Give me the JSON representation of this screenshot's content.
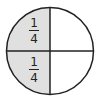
{
  "diagram": {
    "type": "fraction-circle",
    "parts": 4,
    "shaded_parts": 2,
    "shade_color": "#e0e0e0",
    "line_color": "#222222",
    "background": "#ffffff",
    "quadrants": [
      {
        "position": "top-left",
        "shaded": true,
        "label": {
          "numerator": "1",
          "denominator": "4"
        }
      },
      {
        "position": "top-right",
        "shaded": false,
        "label": null
      },
      {
        "position": "bottom-right",
        "shaded": false,
        "label": null
      },
      {
        "position": "bottom-left",
        "shaded": true,
        "label": {
          "numerator": "1",
          "denominator": "4"
        }
      }
    ]
  }
}
